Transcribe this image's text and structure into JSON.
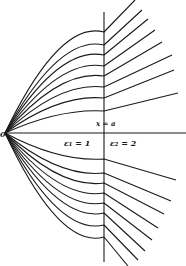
{
  "figure": {
    "origin_label": "0",
    "interface_label": "x = a",
    "region1_label": "ε₁ = 1",
    "region2_label": "ε₂ = 2",
    "line_color": "#1a1a1a",
    "background": "#ffffff"
  },
  "geometry": {
    "origin": [
      5,
      133
    ],
    "axis_end_x": 186,
    "interface_x": 104,
    "interface_y_range": [
      12,
      262
    ],
    "rays_upper": [
      {
        "hit_y": 32,
        "end": [
          135,
          0
        ]
      },
      {
        "hit_y": 45,
        "end": [
          142,
          10
        ]
      },
      {
        "hit_y": 55,
        "end": [
          148,
          19
        ]
      },
      {
        "hit_y": 66,
        "end": [
          155,
          30
        ]
      },
      {
        "hit_y": 76,
        "end": [
          162,
          42
        ]
      },
      {
        "hit_y": 87,
        "end": [
          172,
          55
        ]
      },
      {
        "hit_y": 98,
        "end": [
          174,
          70
        ]
      },
      {
        "hit_y": 111,
        "end": [
          178,
          93
        ]
      }
    ],
    "rays_lower": [
      {
        "hit_y": 159,
        "end": [
          176,
          180
        ]
      },
      {
        "hit_y": 173,
        "end": [
          171,
          201
        ]
      },
      {
        "hit_y": 183,
        "end": [
          164,
          214
        ]
      },
      {
        "hit_y": 193,
        "end": [
          158,
          228
        ]
      },
      {
        "hit_y": 203,
        "end": [
          152,
          240
        ]
      },
      {
        "hit_y": 213,
        "end": [
          145,
          251
        ]
      },
      {
        "hit_y": 225,
        "end": [
          138,
          260
        ]
      },
      {
        "hit_y": 237,
        "end": [
          128,
          266
        ]
      }
    ]
  }
}
